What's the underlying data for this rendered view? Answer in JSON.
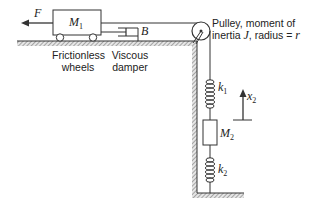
{
  "diagram": {
    "force_label": "F",
    "mass1": {
      "label": "M",
      "sub": "1"
    },
    "damper_label": "B",
    "wheels_caption": [
      "Frictionless",
      "wheels"
    ],
    "damper_caption": [
      "Viscous",
      "damper"
    ],
    "pulley_caption": {
      "line1": "Pulley, moment of",
      "line2_prefix": "inertia ",
      "line2_J": "J",
      "line2_mid": ", radius = ",
      "line2_r": "r"
    },
    "spring1": {
      "label": "k",
      "sub": "1"
    },
    "spring2": {
      "label": "k",
      "sub": "2"
    },
    "mass2": {
      "label": "M",
      "sub": "2"
    },
    "displacement": {
      "label": "x",
      "sub": "2"
    },
    "colors": {
      "line": "#333333",
      "hatch": "#888888",
      "text": "#222222"
    }
  }
}
